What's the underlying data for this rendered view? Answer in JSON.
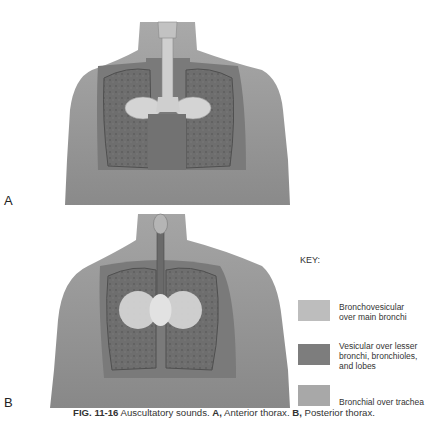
{
  "figure": {
    "panel_a_label": "A",
    "panel_b_label": "B",
    "caption": {
      "fig_number": "FIG. 11-16",
      "title": " Auscultatory sounds. ",
      "a_label": "A,",
      "a_text": " Anterior thorax. ",
      "b_label": "B,",
      "b_text": " Posterior thorax."
    }
  },
  "key": {
    "title": "KEY:",
    "items": [
      {
        "label": "Bronchovesicular over main bronchi",
        "line1": "Bronchovesicular",
        "line2": "over main bronchi",
        "line3": "",
        "color": "#bdbdbd"
      },
      {
        "label": "Vesicular over lesser bronchi, bronchioles, and lobes",
        "line1": "Vesicular over lesser",
        "line2": "bronchi, bronchioles,",
        "line3": "and lobes",
        "color": "#7d7d7d"
      },
      {
        "label": "Bronchial over trachea",
        "line1": "Bronchial over trachea",
        "line2": "",
        "line3": "",
        "color": "#a8a8a8"
      }
    ]
  },
  "colors": {
    "skin": "#8c8c8c",
    "skin_light": "#a3a3a3",
    "thorax_band": "#777777",
    "lung": "#6a6a6a",
    "bronchovesicular_zone": "#d8d8d8",
    "trachea": "#cfcfcf"
  }
}
